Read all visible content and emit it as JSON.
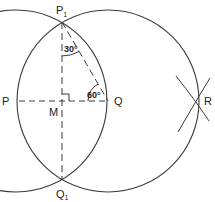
{
  "diagram": {
    "points": {
      "P": {
        "label": "P",
        "x": 16,
        "y": 101
      },
      "Q": {
        "label": "Q",
        "x": 108,
        "y": 101
      },
      "M": {
        "label": "M",
        "x": 62,
        "y": 101
      },
      "P1": {
        "label": "P",
        "sub": "1",
        "x": 62,
        "y": 22
      },
      "Q1": {
        "label": "Q",
        "sub": "1",
        "x": 62,
        "y": 180
      },
      "R": {
        "label": "R",
        "x": 196,
        "y": 101
      }
    },
    "angles": {
      "top": "30°",
      "right": "60°"
    },
    "radius": 91,
    "colors": {
      "stroke": "#3a3a3a",
      "text": "#222222",
      "background": "#ffffff"
    }
  }
}
